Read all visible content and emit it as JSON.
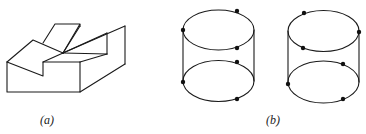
{
  "figure": {
    "panels": [
      {
        "id": "a",
        "label": "(a)",
        "description": "Isometric line drawing of a notched block with fan of planes meeting at a vertex"
      },
      {
        "id": "b",
        "label": "(b)",
        "description": "Two wireframe cylinders, each with six marked points on top and bottom ellipses"
      }
    ],
    "colors": {
      "stroke": "#1a1a1a",
      "dot": "#111111",
      "background": "#ffffff"
    }
  }
}
